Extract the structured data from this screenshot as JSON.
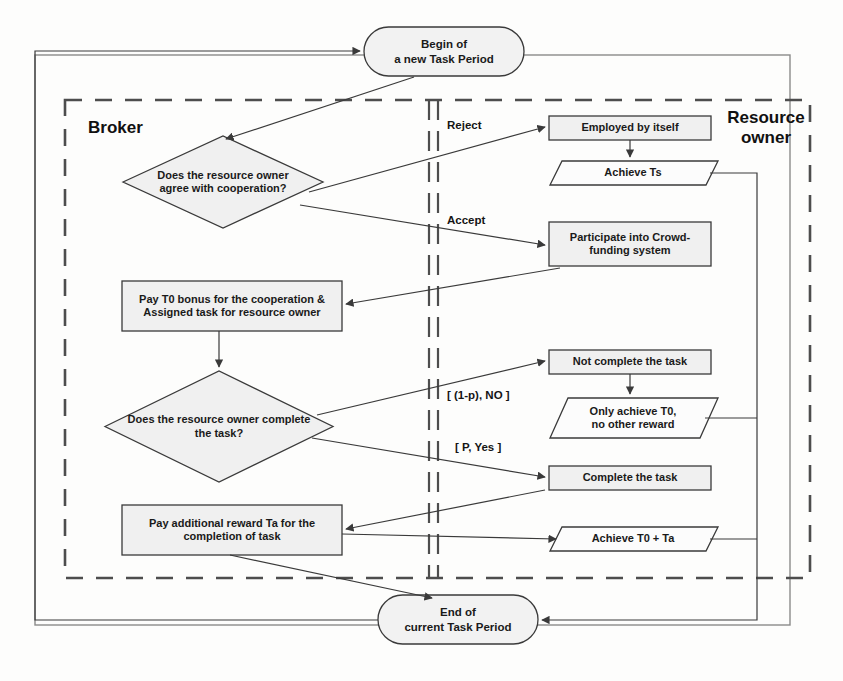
{
  "diagram": {
    "lanes": [
      {
        "id": "broker",
        "label": "Broker"
      },
      {
        "id": "resource_owner",
        "label": "Resource\nowner"
      }
    ],
    "colors": {
      "stroke": "#3a3a3a",
      "terminator_fill": "#f2f2f2",
      "process_fill": "#f0f0f0",
      "decision_fill": "#f0f0f0",
      "data_fill": "#fcfcfc",
      "text": "#1a1a1a",
      "dashed_border": "#4d4d4d",
      "solid_border": "#6b6b6b"
    },
    "nodes": [
      {
        "id": "begin",
        "shape": "terminator",
        "lane": "none",
        "label": "Begin of\na new Task Period",
        "x": 364,
        "y": 27,
        "w": 160,
        "h": 49,
        "font": 11.5
      },
      {
        "id": "decide_cooperate",
        "shape": "decision",
        "lane": "broker",
        "label": "Does the resource owner\nagree with cooperation?",
        "x": 123,
        "y": 136,
        "w": 200,
        "h": 92,
        "font": 11
      },
      {
        "id": "employed_by_itself",
        "shape": "process",
        "lane": "resource_owner",
        "label": "Employed by itself",
        "x": 549,
        "y": 116,
        "w": 162,
        "h": 24,
        "font": 11
      },
      {
        "id": "achieve_ts",
        "shape": "data",
        "lane": "resource_owner",
        "label": "Achieve Ts",
        "x": 556,
        "y": 161,
        "w": 162,
        "h": 24,
        "font": 11
      },
      {
        "id": "participate_crowdfunding",
        "shape": "process",
        "lane": "resource_owner",
        "label": "Participate into Crowd-\nfunding system",
        "x": 549,
        "y": 222,
        "w": 162,
        "h": 44,
        "font": 11
      },
      {
        "id": "pay_t0_bonus",
        "shape": "process",
        "lane": "broker",
        "label": "Pay T0  bonus for the cooperation &\nAssigned task for resource owner",
        "x": 122,
        "y": 281,
        "w": 220,
        "h": 50,
        "font": 11
      },
      {
        "id": "decide_complete",
        "shape": "decision",
        "lane": "broker",
        "label": "Does the resource owner complete\nthe task?",
        "x": 105,
        "y": 371,
        "w": 228,
        "h": 111,
        "font": 11
      },
      {
        "id": "not_complete",
        "shape": "process",
        "lane": "resource_owner",
        "label": "Not complete the task",
        "x": 549,
        "y": 350,
        "w": 162,
        "h": 24,
        "font": 11
      },
      {
        "id": "only_achieve_t0",
        "shape": "data",
        "lane": "resource_owner",
        "label": "Only achieve T0,\nno other reward",
        "x": 556,
        "y": 398,
        "w": 162,
        "h": 40,
        "font": 11
      },
      {
        "id": "complete_task",
        "shape": "process",
        "lane": "resource_owner",
        "label": "Complete the task",
        "x": 549,
        "y": 466,
        "w": 162,
        "h": 24,
        "font": 11
      },
      {
        "id": "achieve_t0_ta",
        "shape": "data",
        "lane": "resource_owner",
        "label": "Achieve T0 + Ta",
        "x": 556,
        "y": 527,
        "w": 162,
        "h": 24,
        "font": 11
      },
      {
        "id": "pay_additional_reward",
        "shape": "process",
        "lane": "broker",
        "label": "Pay additional reward Ta  for the\ncompletion of task",
        "x": 122,
        "y": 505,
        "w": 220,
        "h": 50,
        "font": 11
      },
      {
        "id": "end",
        "shape": "terminator",
        "lane": "none",
        "label": "End of\ncurrent Task Period",
        "x": 378,
        "y": 595,
        "w": 160,
        "h": 49,
        "font": 11.5
      }
    ],
    "edge_labels": [
      {
        "id": "reject",
        "text": "Reject",
        "x": 447,
        "y": 119
      },
      {
        "id": "accept",
        "text": "Accept",
        "x": 447,
        "y": 214
      },
      {
        "id": "no_branch",
        "text": "[ (1-p), NO ]",
        "x": 447,
        "y": 389
      },
      {
        "id": "yes_branch",
        "text": "[ P, Yes ]",
        "x": 455,
        "y": 441
      }
    ],
    "frames": {
      "outer_loop": {
        "x": 35,
        "y": 55,
        "w": 755,
        "h": 570
      },
      "dashed_swimlane": {
        "x": 65,
        "y": 100,
        "w": 745,
        "h": 478
      },
      "divider_x": 432
    }
  }
}
